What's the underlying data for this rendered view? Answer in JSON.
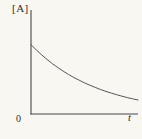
{
  "colors": {
    "background": "#f8f7f2",
    "axis": "#474747",
    "curve": "#565656",
    "text": "#2e2d2b"
  },
  "chart_data": {
    "type": "line",
    "title": "",
    "ylabel": "[A]",
    "xlabel": "t",
    "origin_tick": "0",
    "grid": false,
    "legend": false,
    "xlim": [
      0,
      1
    ],
    "ylim": [
      0,
      1.5
    ],
    "x": [
      0,
      0.05,
      0.1,
      0.15,
      0.2,
      0.25,
      0.3,
      0.35,
      0.4,
      0.45,
      0.5,
      0.55,
      0.6,
      0.65,
      0.7,
      0.75,
      0.8,
      0.85,
      0.9,
      0.95,
      1.0
    ],
    "values": [
      1.0,
      0.923,
      0.852,
      0.787,
      0.726,
      0.67,
      0.619,
      0.571,
      0.527,
      0.487,
      0.449,
      0.415,
      0.383,
      0.354,
      0.326,
      0.301,
      0.278,
      0.257,
      0.237,
      0.219,
      0.202
    ]
  }
}
